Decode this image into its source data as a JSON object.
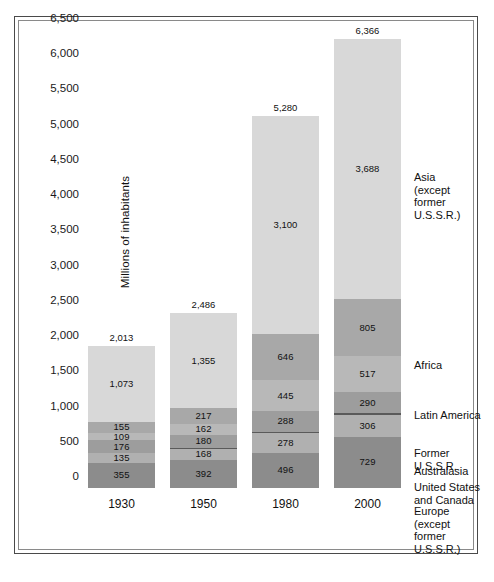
{
  "figure": {
    "y_axis_title": "Millions of inhabitants"
  },
  "chart_data": {
    "type": "bar",
    "title": "",
    "xlabel": "",
    "ylabel": "Millions of inhabitants",
    "ylim": [
      0,
      6500
    ],
    "ytick_step": 500,
    "yticks": [
      "0",
      "500",
      "1,000",
      "1,500",
      "2,000",
      "2,500",
      "3,000",
      "3,500",
      "4,000",
      "4,500",
      "5,000",
      "5,500",
      "6,000",
      "6,500"
    ],
    "grid": false,
    "legend_position": "right",
    "stacked": true,
    "categories": [
      "1930",
      "1950",
      "1980",
      "2000"
    ],
    "totals": [
      2013,
      2486,
      5280,
      6366
    ],
    "total_labels": [
      "2,013",
      "2,486",
      "5,280",
      "6,366"
    ],
    "series": [
      {
        "name": "Europe (except former U.S.S.R.)",
        "legend_label": "Europe\n(except\nformer\nU.S.S.R.)",
        "color": "#8c8c8c",
        "values": [
          355,
          392,
          496,
          729
        ],
        "labels": [
          "355",
          "392",
          "496",
          "729"
        ]
      },
      {
        "name": "United States and Canada",
        "legend_label": "United States\nand Canada",
        "color": "#b0b0b0",
        "values": [
          135,
          168,
          278,
          306
        ],
        "labels": [
          "135",
          "168",
          "278",
          "306"
        ]
      },
      {
        "name": "Australasia",
        "legend_label": "Australasia",
        "color": "#5a5a5a",
        "values": [
          10,
          13,
          23,
          31
        ],
        "labels": [
          "",
          "",
          "",
          ""
        ]
      },
      {
        "name": "Former U.S.S.R.",
        "legend_label": "Former U.S.S.R.",
        "color": "#9d9d9d",
        "values": [
          176,
          180,
          288,
          290
        ],
        "labels": [
          "176",
          "180",
          "288",
          "290"
        ]
      },
      {
        "name": "Latin America",
        "legend_label": "Latin America",
        "color": "#b8b8b8",
        "values": [
          109,
          162,
          445,
          517
        ],
        "labels": [
          "109",
          "162",
          "445",
          "517"
        ]
      },
      {
        "name": "Africa",
        "legend_label": "Africa",
        "color": "#a8a8a8",
        "values": [
          155,
          217,
          646,
          805
        ],
        "labels": [
          "155",
          "217",
          "646",
          "805"
        ]
      },
      {
        "name": "Asia (except former U.S.S.R.)",
        "legend_label": "Asia\n(except\nformer\nU.S.S.R.)",
        "color": "#d8d8d8",
        "values": [
          1073,
          1355,
          3100,
          3688
        ],
        "labels": [
          "1,073",
          "1,355",
          "3,100",
          "3,688"
        ]
      }
    ]
  },
  "legend": [
    {
      "label": "Asia\n(except\nformer\nU.S.S.R.)",
      "top": 171
    },
    {
      "label": "Africa",
      "top": 359
    },
    {
      "label": "Latin America",
      "top": 409
    },
    {
      "label": "Former U.S.S.R.",
      "top": 447
    },
    {
      "label": "Australasia",
      "top": 465
    },
    {
      "label": "United States\nand Canada",
      "top": 481
    },
    {
      "label": "Europe\n(except\nformer\nU.S.S.R.)",
      "top": 505
    }
  ]
}
